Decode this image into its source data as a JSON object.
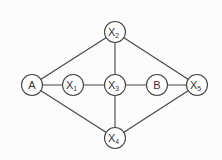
{
  "diagram": {
    "type": "graph",
    "colors": {
      "edge": "#444444",
      "node_stroke": "#444444",
      "node_fill": "#ffffff",
      "text": "#333333",
      "background": "#fcfcfc"
    },
    "nodes": [
      {
        "id": "A",
        "label": "A",
        "sub": ""
      },
      {
        "id": "X1",
        "label": "X",
        "sub": "1"
      },
      {
        "id": "X2",
        "label": "X",
        "sub": "2"
      },
      {
        "id": "X3",
        "label": "X",
        "sub": "3"
      },
      {
        "id": "X4",
        "label": "X",
        "sub": "4"
      },
      {
        "id": "X5",
        "label": "X",
        "sub": "5"
      },
      {
        "id": "B",
        "label": "B",
        "sub": ""
      }
    ],
    "edges": [
      {
        "from": "A",
        "to": "X2"
      },
      {
        "from": "A",
        "to": "X1"
      },
      {
        "from": "A",
        "to": "X4"
      },
      {
        "from": "X1",
        "to": "X3"
      },
      {
        "from": "X2",
        "to": "X3"
      },
      {
        "from": "X2",
        "to": "X5"
      },
      {
        "from": "X3",
        "to": "B"
      },
      {
        "from": "X3",
        "to": "X4"
      },
      {
        "from": "B",
        "to": "X5"
      },
      {
        "from": "X4",
        "to": "X5"
      }
    ]
  }
}
